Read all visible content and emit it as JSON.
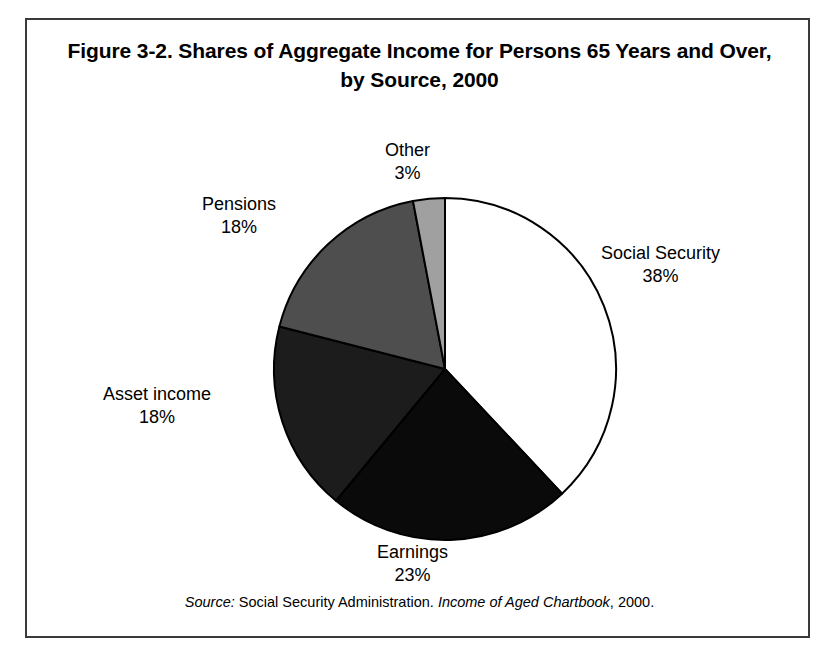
{
  "figure": {
    "title": "Figure 3-2. Shares of Aggregate Income for Persons 65 Years and Over,  by Source, 2000",
    "title_line1": "Figure 3-2. Shares of Aggregate Income for Persons 65 Years",
    "title_line2": "and Over,  by Source, 2000",
    "source_prefix": "Source:",
    "source_agency": " Social Security Administration. ",
    "source_publication": "Income of Aged Chartbook",
    "source_suffix": ", 2000.",
    "border_color": "#3a3a3a"
  },
  "chart_data": {
    "type": "pie",
    "title": "Figure 3-2. Shares of Aggregate Income for Persons 65 Years and Over,  by Source, 2000",
    "xlabel": "",
    "ylabel": "",
    "units": "percent",
    "start_angle_deg": 0,
    "direction": "clockwise",
    "legend": "none (direct labels)",
    "grid": false,
    "categories": [
      "Social Security",
      "Earnings",
      "Asset income",
      "Pensions",
      "Other"
    ],
    "values": [
      38,
      23,
      18,
      18,
      3
    ],
    "labels": [
      "38%",
      "23%",
      "18%",
      "18%",
      "3%"
    ],
    "colors": [
      "#ffffff",
      "#0a0a0a",
      "#1c1c1c",
      "#4e4e4e",
      "#a0a0a0"
    ],
    "slices": [
      {
        "name": "Social Security",
        "value": 38,
        "label": "38%",
        "color": "#ffffff",
        "stroke": "#000000"
      },
      {
        "name": "Earnings",
        "value": 23,
        "label": "23%",
        "color": "#0a0a0a",
        "stroke": "#000000"
      },
      {
        "name": "Asset income",
        "value": 18,
        "label": "18%",
        "color": "#1c1c1c",
        "stroke": "#000000"
      },
      {
        "name": "Pensions",
        "value": 18,
        "label": "18%",
        "color": "#4e4e4e",
        "stroke": "#000000"
      },
      {
        "name": "Other",
        "value": 3,
        "label": "3%",
        "color": "#a0a0a0",
        "stroke": "#000000"
      }
    ],
    "total": 100,
    "geometry": {
      "cx": 418,
      "cy": 349,
      "r": 171
    }
  }
}
